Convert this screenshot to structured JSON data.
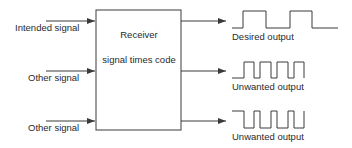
{
  "diagram": {
    "block": {
      "title": "Receiver",
      "subtitle": "signal times code"
    },
    "inputs": [
      {
        "label": "Intended signal"
      },
      {
        "label": "Other signal"
      },
      {
        "label": "Other signal"
      }
    ],
    "outputs": [
      {
        "label": "Desired output",
        "waveform": "square-slow"
      },
      {
        "label": "Unwanted output",
        "waveform": "pulses-fast"
      },
      {
        "label": "Unwanted output",
        "waveform": "inverted-pulses-fast"
      }
    ],
    "colors": {
      "line": "#3a3a3a",
      "text": "#2a2a2a",
      "background": "#ffffff"
    }
  }
}
